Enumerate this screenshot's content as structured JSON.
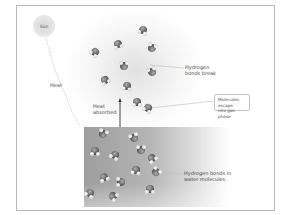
{
  "diagram": {
    "sun": {
      "label": "Sun"
    },
    "labels": {
      "heat": "Heat",
      "heat_absorbed_line1": "Heat",
      "heat_absorbed_line2": "absorbed",
      "bonds_break_line1": "Hydrogen",
      "bonds_break_line2": "bonds break",
      "escape_line1": "Molecules escape",
      "escape_line2": "into gas phase",
      "bonds_water_line1": "Hydrogen bonds in",
      "bonds_water_line2": "water molecules"
    },
    "colors": {
      "frame": "#b8b8b8",
      "water": "#a8a8a8",
      "molecule_oxygen": "#6e6e6e",
      "molecule_hydrogen": "#f0f0f0",
      "text": "#4a4a4a"
    },
    "molecules_gas_count": 10,
    "molecules_liquid_count": 13
  }
}
